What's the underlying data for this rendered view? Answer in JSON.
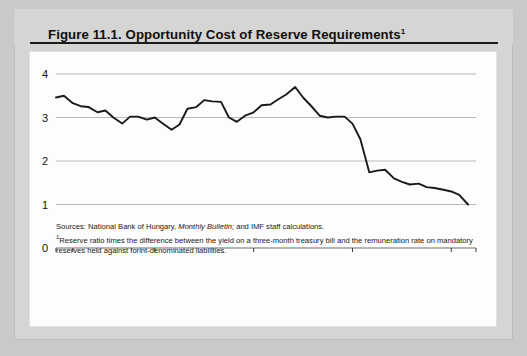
{
  "figure": {
    "title_main": "Figure 11.1.  Opportunity Cost of Reserve Requirements",
    "title_superscript": "1"
  },
  "notes": {
    "sources_label": "Sources:",
    "sources_text_a": "National Bank of Hungary,",
    "sources_italic": "Monthly Bulletin;",
    "sources_text_b": "and IMF staff calculations.",
    "footnote_marker": "1",
    "footnote_text": "Reserve ratio times the difference between the yield on a three-month treasury bill and the remuneration rate on mandatory reserves held against forint-denominated liabilities."
  },
  "chart_data": {
    "type": "line",
    "title": "Opportunity Cost of Reserve Requirements",
    "xlabel": "",
    "ylabel": "",
    "ylim": [
      0,
      4
    ],
    "xlim": [
      1993.0,
      1997.25
    ],
    "grid": true,
    "grid_axis": "y",
    "legend": false,
    "yticks": [
      0,
      1,
      2,
      3,
      4
    ],
    "ytick_labels": [
      "0",
      "1",
      "2",
      "3",
      "4"
    ],
    "xticks": [
      1993.0,
      1994.0,
      1995.0,
      1996.0,
      1997.0
    ],
    "xtick_labels": [
      "1993",
      "94",
      "95",
      "96",
      "97"
    ],
    "line_color": "#1a1a1a",
    "grid_color": "#b9b9b9",
    "series": [
      {
        "name": "Opportunity cost of reserve requirements",
        "x": [
          1993.0,
          1993.08,
          1993.17,
          1993.25,
          1993.33,
          1993.42,
          1993.5,
          1993.58,
          1993.67,
          1993.75,
          1993.83,
          1993.92,
          1994.0,
          1994.08,
          1994.17,
          1994.25,
          1994.33,
          1994.42,
          1994.5,
          1994.58,
          1994.67,
          1994.75,
          1994.83,
          1994.92,
          1995.0,
          1995.08,
          1995.17,
          1995.25,
          1995.33,
          1995.42,
          1995.5,
          1995.58,
          1995.67,
          1995.75,
          1995.83,
          1995.92,
          1996.0,
          1996.08,
          1996.17,
          1996.25,
          1996.33,
          1996.42,
          1996.5,
          1996.58,
          1996.67,
          1996.75,
          1996.83,
          1996.92,
          1997.0,
          1997.08,
          1997.17
        ],
        "values": [
          3.46,
          3.5,
          3.33,
          3.26,
          3.24,
          3.12,
          3.16,
          3.0,
          2.86,
          3.02,
          3.02,
          2.95,
          3.0,
          2.86,
          2.72,
          2.84,
          3.2,
          3.24,
          3.4,
          3.37,
          3.36,
          3.0,
          2.9,
          3.05,
          3.12,
          3.28,
          3.3,
          3.42,
          3.53,
          3.7,
          3.46,
          3.27,
          3.04,
          3.0,
          3.02,
          3.02,
          2.86,
          2.5,
          1.74,
          1.78,
          1.8,
          1.6,
          1.52,
          1.46,
          1.48,
          1.4,
          1.38,
          1.34,
          1.3,
          1.22,
          1.0
        ]
      }
    ]
  }
}
